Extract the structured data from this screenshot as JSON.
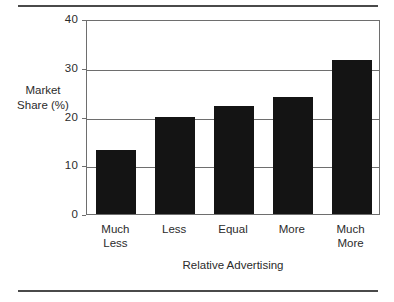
{
  "chart_data": {
    "type": "bar",
    "title": "",
    "subtitle": "",
    "xlabel": "Relative Advertising",
    "ylabel": "Market Share (%)",
    "ylabel_lines": [
      "Market",
      "Share",
      "(%)"
    ],
    "categories": [
      "Much Less",
      "Less",
      "Equal",
      "More",
      "Much More"
    ],
    "category_lines": [
      [
        "Much",
        "Less"
      ],
      [
        "Less",
        ""
      ],
      [
        "Equal",
        ""
      ],
      [
        "More",
        ""
      ],
      [
        "Much",
        "More"
      ]
    ],
    "values": [
      13.1,
      20.0,
      22.2,
      24.0,
      31.5
    ],
    "ylim": [
      0,
      40
    ],
    "yticks": [
      0,
      10,
      20,
      30,
      40
    ],
    "ytick_labels": [
      "0",
      "10",
      "20",
      "30",
      "40"
    ],
    "grid": true,
    "grid_axis": "y",
    "legend": false,
    "bar_color": "#141414",
    "axis_color": "#6e6e6e",
    "rule_color": "#4a4a4a"
  },
  "figure": {
    "top_rule": "horizontal-rule",
    "bottom_rule": "horizontal-rule"
  }
}
